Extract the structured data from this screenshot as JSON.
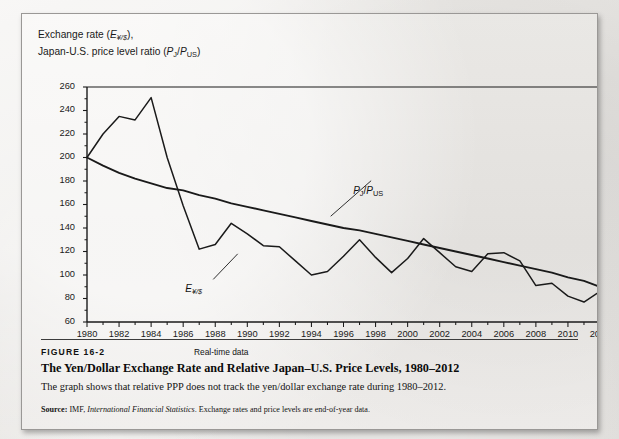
{
  "figure": {
    "number": "FIGURE 16-2",
    "realtime_tag": "Real-time data",
    "title": "The Yen/Dollar Exchange Rate and Relative Japan–U.S. Price Levels, 1980–2012",
    "description": "The graph shows that relative PPP does not track the yen/dollar exchange rate during 1980–2012.",
    "source_label": "Source:",
    "source_body_1": " IMF, ",
    "source_italic": "International Financial Statistics",
    "source_body_2": ". Exchange rates and price levels are end-of-year data."
  },
  "axis_caption": {
    "line1_pre": "Exchange rate (",
    "line1_sym": "E",
    "line1_sub": "¥/$",
    "line1_post": "),",
    "line2_pre": "Japan-U.S. price level ratio (",
    "line2_sym1": "P",
    "line2_sub1": "J",
    "line2_slash": "/",
    "line2_sym2": "P",
    "line2_sub2": "US",
    "line2_post": ")"
  },
  "labels": {
    "exchange_rate": {
      "sym": "E",
      "sub": "¥/$"
    },
    "price_ratio": {
      "sym1": "P",
      "sub1": "J",
      "slash": "/",
      "sym2": "P",
      "sub2": "US"
    }
  },
  "colors": {
    "line": "#1a1a1a",
    "axis": "#1a1a1a",
    "page": "#e9e7e4",
    "panel": "#eeecea",
    "text": "#111111"
  },
  "chart_data": {
    "type": "line",
    "title": "The Yen/Dollar Exchange Rate and Relative Japan–U.S. Price Levels, 1980–2012",
    "xlabel": "",
    "ylabel": "Exchange rate (E¥/$), Japan-U.S. price level ratio (PJ/PUS)",
    "xlim": [
      1980,
      2012
    ],
    "ylim": [
      60,
      260
    ],
    "ytick_step": 20,
    "xtick_step": 2,
    "grid": false,
    "legend": "inline-annotations",
    "yticks": [
      60,
      80,
      100,
      120,
      140,
      160,
      180,
      200,
      220,
      240,
      260
    ],
    "xticks": [
      1980,
      1982,
      1984,
      1986,
      1988,
      1990,
      1992,
      1994,
      1996,
      1998,
      2000,
      2002,
      2004,
      2006,
      2008,
      2010,
      2012
    ],
    "x": [
      1980,
      1981,
      1982,
      1983,
      1984,
      1985,
      1986,
      1987,
      1988,
      1989,
      1990,
      1991,
      1992,
      1993,
      1994,
      1995,
      1996,
      1997,
      1998,
      1999,
      2000,
      2001,
      2002,
      2003,
      2004,
      2005,
      2006,
      2007,
      2008,
      2009,
      2010,
      2011,
      2012
    ],
    "series": [
      {
        "name": "E¥/$",
        "label": "Exchange rate (yen per dollar)",
        "values": [
          200,
          220,
          235,
          232,
          251,
          200,
          159,
          122,
          126,
          144,
          135,
          125,
          124,
          112,
          100,
          103,
          116,
          130,
          115,
          102,
          114,
          131,
          119,
          107,
          103,
          118,
          119,
          112,
          91,
          93,
          82,
          77,
          86
        ]
      },
      {
        "name": "PJ/PUS",
        "label": "Japan-U.S. price level ratio",
        "values": [
          200,
          193,
          187,
          182,
          178,
          174,
          172,
          168,
          165,
          161,
          158,
          155,
          152,
          149,
          146,
          143,
          140,
          138,
          135,
          132,
          129,
          126,
          123,
          120,
          117,
          114,
          111,
          108,
          105,
          102,
          98,
          95,
          90
        ]
      }
    ],
    "annotations": [
      {
        "text": "E¥/$",
        "x": 1987.0,
        "y": 92,
        "points_to": {
          "x": 1989.4,
          "y": 118
        }
      },
      {
        "text": "PJ/PUS",
        "x": 1997.6,
        "y": 176,
        "points_to": {
          "x": 1995.2,
          "y": 150
        }
      }
    ]
  }
}
